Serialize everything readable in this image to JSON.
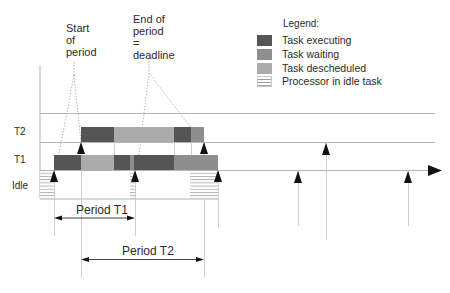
{
  "annotations": {
    "start_of_period": "Start\nof\nperiod",
    "end_of_period": "End of\nperiod\n=\ndeadline"
  },
  "legend": {
    "title": "Legend:",
    "items": [
      {
        "label": "Task executing",
        "color": "#555555",
        "pattern": "solid"
      },
      {
        "label": "Task waiting",
        "color": "#8e8e8e",
        "pattern": "solid"
      },
      {
        "label": "Task descheduled",
        "color": "#ababab",
        "pattern": "solid"
      },
      {
        "label": "Processor in idle task",
        "color": "#ffffff",
        "pattern": "hatched"
      }
    ]
  },
  "rows": {
    "t2": "T2",
    "t1": "T1",
    "idle": "Idle"
  },
  "periods": {
    "t1": "Period T1",
    "t2": "Period T2"
  },
  "colors": {
    "executing": "#555555",
    "waiting": "#8e8e8e",
    "descheduled": "#ababab",
    "gridline": "#b5b5b5",
    "arrow": "#111111"
  },
  "timeline": {
    "T2": [
      {
        "state": "executing",
        "x0": 81,
        "x1": 114
      },
      {
        "state": "descheduled",
        "x0": 114,
        "x1": 174
      },
      {
        "state": "executing",
        "x0": 174,
        "x1": 191
      },
      {
        "state": "waiting",
        "x0": 191,
        "x1": 204
      }
    ],
    "T1": [
      {
        "state": "executing",
        "x0": 54,
        "x1": 81
      },
      {
        "state": "descheduled",
        "x0": 81,
        "x1": 114
      },
      {
        "state": "executing",
        "x0": 114,
        "x1": 130
      },
      {
        "state": "waiting",
        "x0": 130,
        "x1": 134
      },
      {
        "state": "executing",
        "x0": 134,
        "x1": 174
      },
      {
        "state": "waiting",
        "x0": 174,
        "x1": 218
      }
    ],
    "Idle": [
      {
        "x0": 40,
        "x1": 54
      },
      {
        "x0": 130,
        "x1": 135
      },
      {
        "x0": 190,
        "x1": 218
      }
    ]
  }
}
